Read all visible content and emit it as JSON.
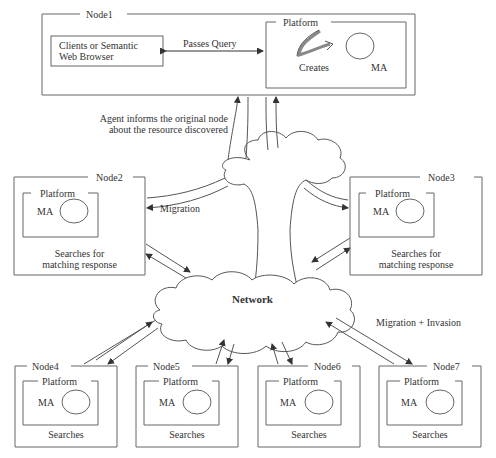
{
  "diagram": {
    "node1": {
      "title": "Node1",
      "client_box": {
        "line1": "Clients or Semantic",
        "line2": "Web Browser"
      },
      "query_label": "Passes Query",
      "platform": {
        "title": "Platform",
        "creates_label": "Creates",
        "agent_label": "MA"
      }
    },
    "inform_label": {
      "line1": "Agent informs the original node",
      "line2": "about the resource discovered"
    },
    "network_label": "Network",
    "migration_label": "Migration",
    "migration_invasion_label": "Migration + Invasion",
    "nodes": [
      {
        "title": "Node2",
        "platform": "Platform",
        "agent": "MA",
        "caption1": "Searches for",
        "caption2": "matching response"
      },
      {
        "title": "Node3",
        "platform": "Platform",
        "agent": "MA",
        "caption1": "Searches for",
        "caption2": "matching response"
      },
      {
        "title": "Node4",
        "platform": "Platform",
        "agent": "MA",
        "caption1": "Searches",
        "caption2": ""
      },
      {
        "title": "Node5",
        "platform": "Platform",
        "agent": "MA",
        "caption1": "Searches",
        "caption2": ""
      },
      {
        "title": "Node6",
        "platform": "Platform",
        "agent": "MA",
        "caption1": "Searches",
        "caption2": ""
      },
      {
        "title": "Node7",
        "platform": "Platform",
        "agent": "MA",
        "caption1": "Searches",
        "caption2": ""
      }
    ],
    "colors": {
      "line": "#555555",
      "arrow": "#333333",
      "creates_arrow": "#888888"
    }
  }
}
